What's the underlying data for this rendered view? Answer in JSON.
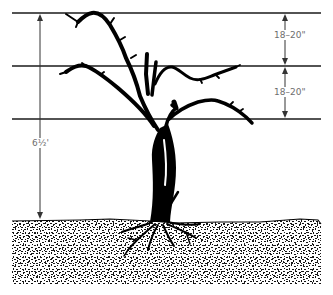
{
  "diagram": {
    "wires": [
      {
        "name": "top-wire",
        "y": 13
      },
      {
        "name": "middle-wire",
        "y": 66
      },
      {
        "name": "bottom-wire",
        "y": 119
      }
    ],
    "dimensions": {
      "top_spacing": "18–20\"",
      "middle_spacing": "18–20\"",
      "total_height": "6½'"
    },
    "colors": {
      "line": "#1a1a1a",
      "vine": "#000000",
      "label": "#6e6e6e",
      "background": "#ffffff"
    }
  }
}
